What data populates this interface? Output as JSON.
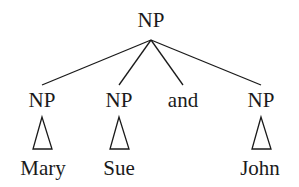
{
  "tree": {
    "root": {
      "label": "NP",
      "x": 151,
      "y": 27
    },
    "children": [
      {
        "label": "NP",
        "x": 42,
        "y": 107,
        "leaf": "Mary",
        "triangle": true
      },
      {
        "label": "NP",
        "x": 119,
        "y": 107,
        "leaf": "Sue",
        "triangle": true
      },
      {
        "label": "and",
        "x": 183,
        "y": 107,
        "leaf": null,
        "triangle": false
      },
      {
        "label": "NP",
        "x": 261,
        "y": 107,
        "leaf": "John",
        "triangle": true
      }
    ],
    "leaf_y": 175,
    "line_color": "#1a1a1a"
  }
}
